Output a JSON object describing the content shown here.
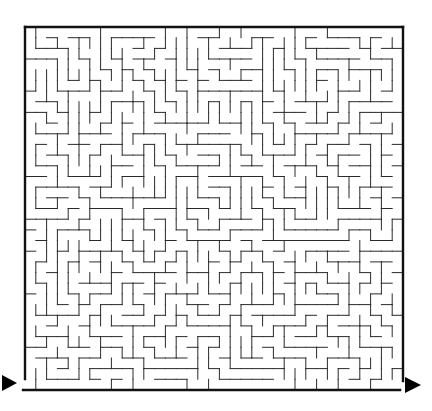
{
  "puzzle": {
    "type": "maze",
    "grid": {
      "cols": 35,
      "rows": 34
    },
    "colors": {
      "wall": "#2a2a2a",
      "border": "#111111",
      "arrow": "#000000",
      "background": "#ffffff"
    },
    "entrance": {
      "side": "bottom-left",
      "icon": "arrow-right-icon"
    },
    "exit": {
      "side": "bottom-right",
      "icon": "arrow-right-icon"
    }
  }
}
